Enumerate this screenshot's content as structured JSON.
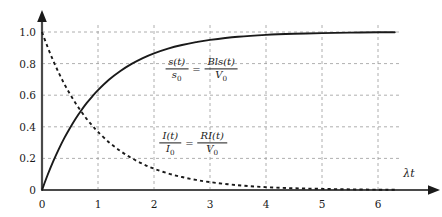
{
  "chart_data": {
    "type": "line",
    "title": "",
    "xlabel": "λt",
    "ylabel": "",
    "xlim": [
      0,
      6.6
    ],
    "ylim": [
      0,
      1.08
    ],
    "grid": true,
    "legend_position": "inline-annotation",
    "xticks": [
      "0",
      "1",
      "2",
      "3",
      "4",
      "5",
      "6"
    ],
    "xtick_values": [
      0,
      1,
      2,
      3,
      4,
      5,
      6
    ],
    "yticks": [
      "0",
      "0.2",
      "0.4",
      "0.6",
      "0.8",
      "1.0"
    ],
    "ytick_values": [
      0,
      0.2,
      0.4,
      0.6,
      0.8,
      1.0
    ],
    "series": [
      {
        "name": "s(t)/s0 = Bls(t)/V0",
        "style": "solid",
        "color": "#1a1a1a",
        "formula": "1 - exp(-x)",
        "x": [
          0,
          0.1,
          0.2,
          0.3,
          0.4,
          0.5,
          0.6,
          0.7,
          0.8,
          0.9,
          1.0,
          1.2,
          1.4,
          1.6,
          1.8,
          2.0,
          2.25,
          2.5,
          2.75,
          3.0,
          3.5,
          4.0,
          4.5,
          5.0,
          5.5,
          6.0,
          6.3
        ],
        "values": [
          0,
          0.095,
          0.181,
          0.259,
          0.33,
          0.393,
          0.451,
          0.503,
          0.551,
          0.593,
          0.632,
          0.699,
          0.753,
          0.798,
          0.835,
          0.865,
          0.895,
          0.918,
          0.936,
          0.95,
          0.97,
          0.982,
          0.989,
          0.993,
          0.996,
          0.998,
          0.998
        ]
      },
      {
        "name": "I(t)/I0 = RI(t)/V0",
        "style": "dashed",
        "color": "#1a1a1a",
        "formula": "exp(-x)",
        "x": [
          0,
          0.1,
          0.2,
          0.3,
          0.4,
          0.5,
          0.6,
          0.7,
          0.8,
          0.9,
          1.0,
          1.2,
          1.4,
          1.6,
          1.8,
          2.0,
          2.25,
          2.5,
          2.75,
          3.0,
          3.5,
          4.0,
          4.5,
          5.0,
          5.5,
          6.0,
          6.3
        ],
        "values": [
          1.0,
          0.905,
          0.819,
          0.741,
          0.67,
          0.607,
          0.549,
          0.497,
          0.449,
          0.407,
          0.368,
          0.301,
          0.247,
          0.202,
          0.165,
          0.135,
          0.105,
          0.082,
          0.064,
          0.05,
          0.03,
          0.018,
          0.011,
          0.007,
          0.004,
          0.002,
          0.002
        ]
      }
    ],
    "annotations": [
      {
        "name": "displacement-formula",
        "lhs_num": "s(t)",
        "lhs_den": "s",
        "lhs_den_sub": "0",
        "equals": "=",
        "rhs_num": "Bls(t)",
        "rhs_den": "V",
        "rhs_den_sub": "0",
        "x": 2.85,
        "y": 0.76
      },
      {
        "name": "current-formula",
        "lhs_num": "I(t)",
        "lhs_den": "I",
        "lhs_den_sub": "0",
        "equals": "=",
        "rhs_num": "RI(t)",
        "rhs_den": "V",
        "rhs_den_sub": "0",
        "x": 2.7,
        "y": 0.29
      }
    ]
  }
}
